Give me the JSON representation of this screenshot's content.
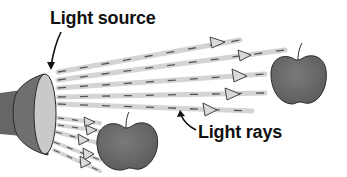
{
  "diagram": {
    "labels": {
      "light_source": "Light source",
      "light_rays": "Light rays"
    },
    "objects": {
      "light_source": "flashlight",
      "targets": [
        "apple-near",
        "apple-far"
      ]
    },
    "colors": {
      "ray": "#d4d4d4",
      "ray_dash": "#555555",
      "arrowhead_fill": "#d9d9d9",
      "arrowhead_stroke": "#444444",
      "apple_fill": "#6e6e6e",
      "apple_stroke": "#2a2a2a",
      "flashlight_body": "#6a6a6a",
      "flashlight_lens": "#c9c9c9",
      "text": "#111111"
    }
  }
}
